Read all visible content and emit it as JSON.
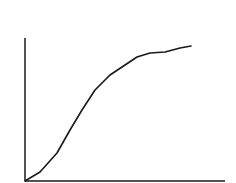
{
  "chart_data": {
    "type": "line",
    "title": "",
    "xlabel": "",
    "ylabel": "",
    "grid": false,
    "legend": null,
    "xlim": [
      0,
      200
    ],
    "ylim": [
      0,
      143
    ],
    "series": [
      {
        "name": "curve",
        "color": "#1a1a1a",
        "x": [
          0,
          15,
          32,
          45,
          57,
          70,
          85,
          100,
          112,
          125,
          140,
          155,
          166
        ],
        "y": [
          0,
          9,
          28,
          51,
          71,
          91,
          106,
          116,
          124,
          128,
          129,
          133,
          135
        ]
      }
    ]
  },
  "colors": {
    "line": "#1a1a1a",
    "axis": "#1a1a1a",
    "background": "#ffffff"
  }
}
